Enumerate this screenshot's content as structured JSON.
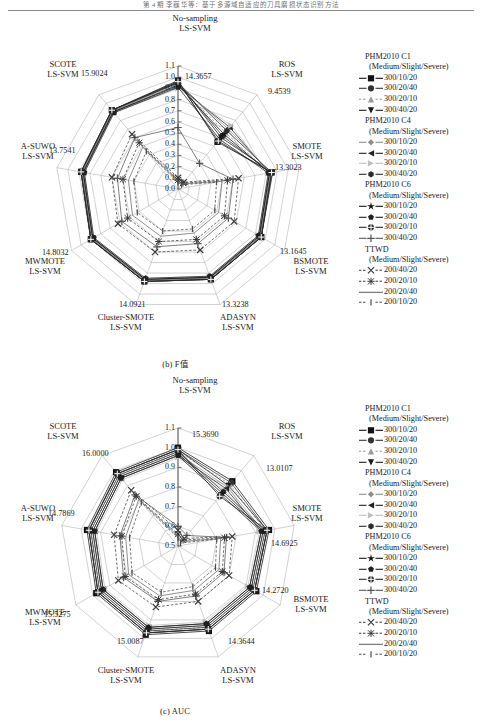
{
  "running_head": "第 4 期        李巍华等：基于多源域自适应的刀具磨损状态识别方法",
  "figures": [
    {
      "id": "fig-b",
      "caption": "(b) F值",
      "chart_data": {
        "type": "radar",
        "title": "",
        "axes": [
          {
            "label_line1": "No-sampling",
            "label_line2": "LS-SVM",
            "value": "14.3657"
          },
          {
            "label_line1": "ROS",
            "label_line2": "LS-SVM",
            "value": "9.4539"
          },
          {
            "label_line1": "SMOTE",
            "label_line2": "LS-SVM",
            "value": "13.3023"
          },
          {
            "label_line1": "BSMOTE",
            "label_line2": "LS-SVM",
            "value": "13.1645"
          },
          {
            "label_line1": "ADASYN",
            "label_line2": "LS-SVM",
            "value": "13.3238"
          },
          {
            "label_line1": "Cluster-SMOTE",
            "label_line2": "LS-SVM",
            "value": "14.0921"
          },
          {
            "label_line1": "MWMOTE",
            "label_line2": "LS-SVM",
            "value": "14.8032"
          },
          {
            "label_line1": "A-SUWO",
            "label_line2": "LS-SVM",
            "value": "13.7541"
          },
          {
            "label_line1": "SCOTE",
            "label_line2": "LS-SVM",
            "value": "15.9024"
          }
        ],
        "ticks": [
          "1.1",
          "1.0",
          "0.9",
          "0.8",
          "0.7",
          "0.6",
          "0.5",
          "0.4",
          "0.3",
          "0.2",
          "0.1",
          "0.0"
        ],
        "rlim": [
          0.0,
          1.1
        ],
        "grid": true,
        "legend_position": "right",
        "series": [
          {
            "name": "PHM2010 C1 300/10/20",
            "values": [
              0.97,
              0.55,
              0.85,
              0.86,
              0.86,
              0.88,
              0.9,
              0.88,
              0.92
            ]
          },
          {
            "name": "PHM2010 C1 300/20/40",
            "values": [
              0.95,
              0.62,
              0.84,
              0.85,
              0.85,
              0.87,
              0.89,
              0.87,
              0.91
            ]
          },
          {
            "name": "PHM2010 C1 300/20/10",
            "values": [
              0.93,
              0.66,
              0.83,
              0.84,
              0.84,
              0.86,
              0.88,
              0.86,
              0.9
            ]
          },
          {
            "name": "PHM2010 C1 300/40/20",
            "values": [
              0.96,
              0.6,
              0.86,
              0.86,
              0.86,
              0.88,
              0.9,
              0.88,
              0.92
            ]
          },
          {
            "name": "PHM2010 C4 300/10/20",
            "values": [
              0.94,
              0.7,
              0.84,
              0.85,
              0.85,
              0.87,
              0.89,
              0.87,
              0.91
            ]
          },
          {
            "name": "PHM2010 C4 300/20/40",
            "values": [
              0.92,
              0.72,
              0.83,
              0.84,
              0.84,
              0.86,
              0.88,
              0.86,
              0.9
            ]
          },
          {
            "name": "PHM2010 C4 300/20/10",
            "values": [
              0.9,
              0.74,
              0.82,
              0.83,
              0.83,
              0.85,
              0.87,
              0.85,
              0.89
            ]
          },
          {
            "name": "PHM2010 C4 300/40/20",
            "values": [
              0.95,
              0.68,
              0.85,
              0.86,
              0.86,
              0.88,
              0.9,
              0.88,
              0.92
            ]
          },
          {
            "name": "PHM2010 C6 300/10/20",
            "values": [
              0.93,
              0.64,
              0.83,
              0.84,
              0.84,
              0.86,
              0.88,
              0.86,
              0.9
            ]
          },
          {
            "name": "PHM2010 C6 300/20/40",
            "values": [
              0.91,
              0.58,
              0.82,
              0.83,
              0.83,
              0.85,
              0.87,
              0.85,
              0.89
            ]
          },
          {
            "name": "PHM2010 C6 300/20/10",
            "values": [
              0.96,
              0.56,
              0.85,
              0.86,
              0.86,
              0.88,
              0.9,
              0.88,
              0.92
            ]
          },
          {
            "name": "PHM2010 C6 300/40/20",
            "values": [
              0.55,
              0.3,
              0.5,
              0.52,
              0.52,
              0.55,
              0.58,
              0.55,
              0.6
            ]
          },
          {
            "name": "TTWD 200/40/20",
            "values": [
              0.1,
              0.08,
              0.55,
              0.58,
              0.58,
              0.6,
              0.62,
              0.6,
              0.64
            ]
          },
          {
            "name": "TTWD 200/20/10",
            "values": [
              0.08,
              0.07,
              0.45,
              0.48,
              0.48,
              0.5,
              0.52,
              0.5,
              0.54
            ]
          },
          {
            "name": "TTWD 200/20/40",
            "values": [
              0.07,
              0.06,
              0.4,
              0.42,
              0.42,
              0.45,
              0.47,
              0.45,
              0.49
            ]
          },
          {
            "name": "TTWD 200/10/20",
            "values": [
              0.06,
              0.05,
              0.35,
              0.38,
              0.38,
              0.4,
              0.42,
              0.4,
              0.44
            ]
          }
        ]
      }
    },
    {
      "id": "fig-c",
      "caption": "(c) AUC",
      "chart_data": {
        "type": "radar",
        "title": "",
        "axes": [
          {
            "label_line1": "No-sampling",
            "label_line2": "LS-SVM",
            "value": "15.3690"
          },
          {
            "label_line1": "ROS",
            "label_line2": "LS-SVM",
            "value": "13.0107"
          },
          {
            "label_line1": "SMOTE",
            "label_line2": "LS-SVM",
            "value": "14.6925"
          },
          {
            "label_line1": "BSMOTE",
            "label_line2": "LS-SVM",
            "value": "14.2720"
          },
          {
            "label_line1": "ADASYN",
            "label_line2": "LS-SVM",
            "value": "14.3644"
          },
          {
            "label_line1": "Cluster-SMOTE",
            "label_line2": "LS-SVM",
            "value": "15.0087"
          },
          {
            "label_line1": "MWMOTE",
            "label_line2": "LS-SVM",
            "value": "15.5275"
          },
          {
            "label_line1": "A-SUWO",
            "label_line2": "LS-SVM",
            "value": "14.7869"
          },
          {
            "label_line1": "SCOTE",
            "label_line2": "LS-SVM",
            "value": "16.0000"
          }
        ],
        "ticks": [
          "1.1",
          "1.0",
          "0.9",
          "0.8",
          "0.7",
          "0.6",
          "0.5"
        ],
        "rlim": [
          0.5,
          1.1
        ],
        "grid": true,
        "legend_position": "right",
        "series": [
          {
            "name": "PHM2010 C1 300/10/20",
            "values": [
              1.0,
              0.93,
              0.97,
              0.96,
              0.96,
              0.98,
              0.98,
              0.97,
              0.99
            ]
          },
          {
            "name": "PHM2010 C1 300/20/40",
            "values": [
              0.99,
              0.92,
              0.96,
              0.95,
              0.95,
              0.97,
              0.97,
              0.96,
              0.98
            ]
          },
          {
            "name": "PHM2010 C1 300/20/10",
            "values": [
              0.98,
              0.91,
              0.95,
              0.94,
              0.94,
              0.96,
              0.96,
              0.95,
              0.97
            ]
          },
          {
            "name": "PHM2010 C1 300/40/20",
            "values": [
              0.99,
              0.9,
              0.96,
              0.95,
              0.95,
              0.97,
              0.97,
              0.96,
              0.98
            ]
          },
          {
            "name": "PHM2010 C4 300/10/20",
            "values": [
              0.97,
              0.89,
              0.94,
              0.93,
              0.93,
              0.95,
              0.95,
              0.94,
              0.96
            ]
          },
          {
            "name": "PHM2010 C4 300/20/40",
            "values": [
              0.96,
              0.88,
              0.93,
              0.92,
              0.92,
              0.94,
              0.94,
              0.93,
              0.95
            ]
          },
          {
            "name": "PHM2010 C4 300/20/10",
            "values": [
              0.95,
              0.87,
              0.92,
              0.91,
              0.91,
              0.93,
              0.93,
              0.92,
              0.94
            ]
          },
          {
            "name": "PHM2010 C4 300/40/20",
            "values": [
              0.98,
              0.86,
              0.95,
              0.94,
              0.94,
              0.96,
              0.96,
              0.95,
              0.97
            ]
          },
          {
            "name": "PHM2010 C6 300/10/20",
            "values": [
              0.97,
              0.85,
              0.94,
              0.93,
              0.93,
              0.95,
              0.95,
              0.94,
              0.96
            ]
          },
          {
            "name": "PHM2010 C6 300/20/40",
            "values": [
              0.96,
              0.84,
              0.93,
              0.92,
              0.92,
              0.94,
              0.94,
              0.93,
              0.95
            ]
          },
          {
            "name": "PHM2010 C6 300/20/10",
            "values": [
              0.99,
              0.83,
              0.96,
              0.95,
              0.95,
              0.97,
              0.97,
              0.96,
              0.98
            ]
          },
          {
            "name": "PHM2010 C6 300/40/20",
            "values": [
              0.6,
              0.57,
              0.75,
              0.77,
              0.77,
              0.8,
              0.82,
              0.8,
              0.84
            ]
          },
          {
            "name": "TTWD 200/40/20",
            "values": [
              0.58,
              0.55,
              0.78,
              0.8,
              0.8,
              0.83,
              0.85,
              0.83,
              0.87
            ]
          },
          {
            "name": "TTWD 200/20/10",
            "values": [
              0.56,
              0.54,
              0.74,
              0.76,
              0.76,
              0.79,
              0.81,
              0.79,
              0.83
            ]
          },
          {
            "name": "TTWD 200/20/40",
            "values": [
              0.55,
              0.53,
              0.72,
              0.74,
              0.74,
              0.77,
              0.79,
              0.77,
              0.81
            ]
          },
          {
            "name": "TTWD 200/10/20",
            "values": [
              0.54,
              0.52,
              0.7,
              0.72,
              0.72,
              0.75,
              0.77,
              0.75,
              0.79
            ]
          }
        ]
      }
    }
  ],
  "legend": {
    "groups": [
      {
        "title": "PHM2010 C1",
        "subtitle": "(Medium/Slight/Severe)",
        "entries": [
          {
            "label": "300/10/20",
            "marker": "filled-square",
            "color": "#111111",
            "dash": "none"
          },
          {
            "label": "300/20/40",
            "marker": "filled-circle",
            "color": "#333333",
            "dash": "none"
          },
          {
            "label": "300/20/10",
            "marker": "filled-triangle-up",
            "color": "#9a9a9a",
            "dash": "dashed"
          },
          {
            "label": "300/40/20",
            "marker": "filled-triangle-down",
            "color": "#1a1a1a",
            "dash": "none"
          }
        ]
      },
      {
        "title": "PHM2010 C4",
        "subtitle": "(Medium/Slight/Severe)",
        "entries": [
          {
            "label": "300/10/20",
            "marker": "filled-diamond",
            "color": "#8e8e8e",
            "dash": "none"
          },
          {
            "label": "300/20/40",
            "marker": "triangle-left",
            "color": "#222222",
            "dash": "none"
          },
          {
            "label": "300/20/10",
            "marker": "triangle-right",
            "color": "#c0c0c0",
            "dash": "none"
          },
          {
            "label": "300/40/20",
            "marker": "filled-hexagon",
            "color": "#2b2b2b",
            "dash": "none"
          }
        ]
      },
      {
        "title": "PHM2010 C6",
        "subtitle": "(Medium/Slight/Severe)",
        "entries": [
          {
            "label": "300/10/20",
            "marker": "star",
            "color": "#141414",
            "dash": "none"
          },
          {
            "label": "300/20/40",
            "marker": "pentagon",
            "color": "#1f1f1f",
            "dash": "none"
          },
          {
            "label": "300/20/10",
            "marker": "circle-cross",
            "color": "#262626",
            "dash": "none"
          },
          {
            "label": "300/40/20",
            "marker": "plus",
            "color": "#555555",
            "dash": "none"
          }
        ]
      },
      {
        "title": "TTWD",
        "subtitle": "(Medium/Slight/Severe)",
        "entries": [
          {
            "label": "200/40/20",
            "marker": "x-cross",
            "color": "#3a3a3a",
            "dash": "dashed"
          },
          {
            "label": "200/20/10",
            "marker": "asterisk",
            "color": "#3a3a3a",
            "dash": "dashed"
          },
          {
            "label": "200/20/40",
            "marker": "none",
            "color": "#6a6a6a",
            "dash": "solid"
          },
          {
            "label": "200/10/20",
            "marker": "vbar",
            "color": "#4a4a4a",
            "dash": "dashed"
          }
        ]
      }
    ]
  }
}
